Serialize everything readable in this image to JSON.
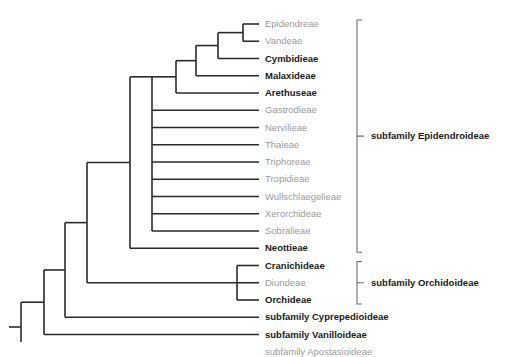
{
  "figure": {
    "type": "cladogram",
    "title": "",
    "background_color": "#ffffff",
    "branch_color": "#2b2b2b",
    "bracket_color": "#6e6e6e",
    "gray_text_color": "#9b9b9b",
    "bold_text_color": "#1a1a1a"
  },
  "tips": [
    {
      "label": "Epidendreae",
      "style": "gray",
      "row": 0
    },
    {
      "label": "Vandeae",
      "style": "gray",
      "row": 1
    },
    {
      "label": "Cymbidieae",
      "style": "bold",
      "row": 2
    },
    {
      "label": "Malaxideae",
      "style": "bold",
      "row": 3
    },
    {
      "label": "Arethuseae",
      "style": "bold",
      "row": 4
    },
    {
      "label": "Gastrodieae",
      "style": "gray",
      "row": 5
    },
    {
      "label": "Nervilieae",
      "style": "gray",
      "row": 6
    },
    {
      "label": "Thaieae",
      "style": "gray",
      "row": 7
    },
    {
      "label": "Triphoreae",
      "style": "gray",
      "row": 8
    },
    {
      "label": "Tropidieae",
      "style": "gray",
      "row": 9
    },
    {
      "label": "Wullschlaegelieae",
      "style": "gray",
      "row": 10
    },
    {
      "label": "Xerorchideae",
      "style": "gray",
      "row": 11
    },
    {
      "label": "Sobralieae",
      "style": "gray",
      "row": 12
    },
    {
      "label": "Neottieae",
      "style": "bold",
      "row": 13
    },
    {
      "label": "Cranichideae",
      "style": "bold",
      "row": 14
    },
    {
      "label": "Diundeae",
      "style": "gray",
      "row": 15
    },
    {
      "label": "Orchideae",
      "style": "bold",
      "row": 16
    },
    {
      "label": "subfamily Cyprepedioideae",
      "style": "bold",
      "row": 17
    },
    {
      "label": "subfamily Vanilloideae",
      "style": "bold",
      "row": 18
    },
    {
      "label": "subfamily Apostasioideae",
      "style": "gray",
      "row": 19
    }
  ],
  "subfamily_brackets": [
    {
      "label": "subfamily Epidendroideae",
      "first_row": 0,
      "last_row": 13,
      "label_row_center": 6.5
    },
    {
      "label": "subfamily Orchidoideae",
      "first_row": 14,
      "last_row": 16,
      "label_row_center": 15
    }
  ],
  "chart_data": {
    "type": "cladogram",
    "n_tips": 20,
    "tip_order": [
      "Epidendreae",
      "Vandeae",
      "Cymbidieae",
      "Malaxideae",
      "Arethuseae",
      "Gastrodieae",
      "Nervilieae",
      "Thaieae",
      "Triphoreae",
      "Tropidieae",
      "Wullschlaegelieae",
      "Xerorchideae",
      "Sobralieae",
      "Neottieae",
      "Cranichideae",
      "Diundeae",
      "Orchideae",
      "subfamily Cyprepedioideae",
      "subfamily Vanilloideae",
      "subfamily Apostasioideae"
    ],
    "newick": "(subfamily Apostasioideae,(subfamily Vanilloideae,(subfamily Cyprepedioideae,((Cranichideae,Diundeae,Orchideae),(Neottieae,(Sobralieae,(Xerorchideae,(Wullschlaegelieae,(Tropidieae,(Triphoreae,(Thaieae,(Nervilieae,(Gastrodieae,(Arethuseae,(Malaxideae,(Cymbidieae,(Vandeae,Epidendreae))))))))))))))));"
  }
}
